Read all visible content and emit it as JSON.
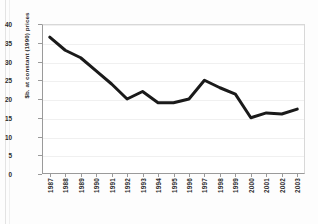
{
  "chart_data": {
    "type": "line",
    "title": "",
    "subtitle": "",
    "xlabel": "",
    "ylabel": "$b. at constant (1990) prices",
    "categories": [
      "1987",
      "1988",
      "1989",
      "1990",
      "1991",
      "1992",
      "1993",
      "1994",
      "1995",
      "1996",
      "1997",
      "1998",
      "1999",
      "2000",
      "2001",
      "2002",
      "2003"
    ],
    "x": [
      1987,
      1988,
      1989,
      1990,
      1991,
      1992,
      1993,
      1994,
      1995,
      1996,
      1997,
      1998,
      1999,
      2000,
      2001,
      2002,
      2003
    ],
    "values": [
      36.5,
      33.0,
      31.0,
      27.5,
      24.0,
      20.0,
      22.0,
      19.0,
      19.0,
      20.0,
      25.0,
      23.0,
      21.3,
      15.0,
      16.3,
      16.0,
      17.3
    ],
    "series": [
      {
        "name": "$b. at constant (1990) prices",
        "values": [
          36.5,
          33.0,
          31.0,
          27.5,
          24.0,
          20.0,
          22.0,
          19.0,
          19.0,
          20.0,
          25.0,
          23.0,
          21.3,
          15.0,
          16.3,
          16.0,
          17.3
        ]
      }
    ],
    "ylim": [
      0,
      40
    ],
    "yticks": [
      0,
      5,
      10,
      15,
      20,
      25,
      30,
      35,
      40
    ],
    "ytick_labels": [
      "0",
      "5",
      "10",
      "15",
      "20",
      "25",
      "30",
      "35",
      "40"
    ],
    "grid": true,
    "grid_axis": "y",
    "legend": false,
    "legend_position": "none",
    "line_color": "#1a1a1a",
    "line_width": 3,
    "markers": false,
    "background_color": "#ffffff",
    "axis_color": "#9a9a9a",
    "gridline_color": "#f0f0f0"
  }
}
